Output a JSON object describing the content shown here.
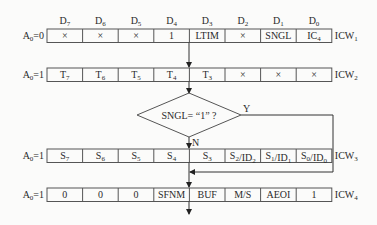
{
  "bit_headers": [
    "D7",
    "D6",
    "D5",
    "D4",
    "D3",
    "D2",
    "D1",
    "D0"
  ],
  "rows": [
    {
      "name": "ICW1",
      "address": "A0=0",
      "cells": [
        "×",
        "×",
        "×",
        "1",
        "LTIM",
        "×",
        "SNGL",
        "IC4"
      ]
    },
    {
      "name": "ICW2",
      "address": "A0=1",
      "cells": [
        "T7",
        "T6",
        "T5",
        "T4",
        "T3",
        "×",
        "×",
        "×"
      ]
    },
    {
      "name": "ICW3",
      "address": "A0=1",
      "cells": [
        "S7",
        "S6",
        "S5",
        "S4",
        "S3",
        "S2/ID2",
        "S1/ID1",
        "S0/ID0"
      ]
    },
    {
      "name": "ICW4",
      "address": "A0=1",
      "cells": [
        "0",
        "0",
        "0",
        "SFNM",
        "BUF",
        "M/S",
        "AEOI",
        "1"
      ]
    }
  ],
  "decision": {
    "text": "SNGL= “1” ?",
    "yes_label": "Y",
    "no_label": "N"
  }
}
